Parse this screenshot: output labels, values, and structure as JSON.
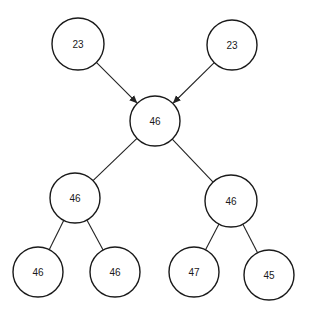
{
  "diagram": {
    "type": "tree",
    "colors": {
      "stroke": "#1a1a1a",
      "fill": "#ffffff",
      "background": "#ffffff"
    },
    "nodes": [
      {
        "id": "top_left",
        "label": "23",
        "cx": 78,
        "cy": 44,
        "r": 26
      },
      {
        "id": "top_right",
        "label": "23",
        "cx": 232,
        "cy": 45,
        "r": 25
      },
      {
        "id": "root",
        "label": "46",
        "cx": 155,
        "cy": 121,
        "r": 25
      },
      {
        "id": "mid_left",
        "label": "46",
        "cx": 75,
        "cy": 198,
        "r": 25
      },
      {
        "id": "mid_right",
        "label": "46",
        "cx": 231,
        "cy": 201,
        "r": 26
      },
      {
        "id": "leaf_1",
        "label": "46",
        "cx": 38,
        "cy": 272,
        "r": 25
      },
      {
        "id": "leaf_2",
        "label": "46",
        "cx": 115,
        "cy": 272,
        "r": 25
      },
      {
        "id": "leaf_3",
        "label": "47",
        "cx": 194,
        "cy": 272,
        "r": 25
      },
      {
        "id": "leaf_4",
        "label": "45",
        "cx": 269,
        "cy": 275,
        "r": 25
      }
    ],
    "edges": [
      {
        "from": "top_left",
        "to": "root",
        "arrow": true
      },
      {
        "from": "top_right",
        "to": "root",
        "arrow": true
      },
      {
        "from": "root",
        "to": "mid_left",
        "arrow": false
      },
      {
        "from": "root",
        "to": "mid_right",
        "arrow": false
      },
      {
        "from": "mid_left",
        "to": "leaf_1",
        "arrow": false
      },
      {
        "from": "mid_left",
        "to": "leaf_2",
        "arrow": false
      },
      {
        "from": "mid_right",
        "to": "leaf_3",
        "arrow": false
      },
      {
        "from": "mid_right",
        "to": "leaf_4",
        "arrow": false
      }
    ]
  }
}
